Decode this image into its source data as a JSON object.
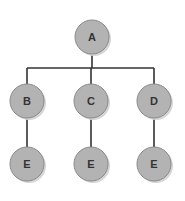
{
  "diagram": {
    "type": "tree",
    "colors": {
      "node_fill": "#b3b3b3",
      "node_stroke": "#8a8a8a",
      "shadow": "#d6d6d6",
      "edge": "#333333",
      "label": "#333333"
    },
    "nodes": [
      {
        "id": "A",
        "label": "A",
        "cx": 92,
        "cy": 37,
        "r": 17
      },
      {
        "id": "B",
        "label": "B",
        "cx": 27,
        "cy": 101,
        "r": 17
      },
      {
        "id": "C",
        "label": "C",
        "cx": 91,
        "cy": 101,
        "r": 17
      },
      {
        "id": "D",
        "label": "D",
        "cx": 154,
        "cy": 101,
        "r": 17
      },
      {
        "id": "E1",
        "label": "E",
        "cx": 27,
        "cy": 164,
        "r": 17
      },
      {
        "id": "E2",
        "label": "E",
        "cx": 91,
        "cy": 164,
        "r": 17
      },
      {
        "id": "E3",
        "label": "E",
        "cx": 154,
        "cy": 164,
        "r": 17
      }
    ],
    "edges": [
      {
        "from": "A",
        "to": "B"
      },
      {
        "from": "A",
        "to": "C"
      },
      {
        "from": "A",
        "to": "D"
      },
      {
        "from": "B",
        "to": "E1"
      },
      {
        "from": "C",
        "to": "E2"
      },
      {
        "from": "D",
        "to": "E3"
      }
    ]
  }
}
